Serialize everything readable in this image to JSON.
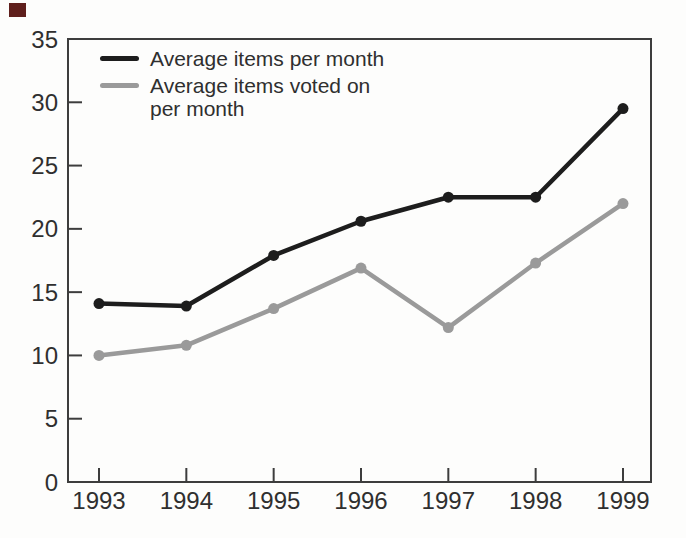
{
  "page": {
    "background": "#fdfdfc",
    "corner_marker_color": "#5f1f1c"
  },
  "chart_data": {
    "type": "line",
    "title": "",
    "xlabel": "",
    "ylabel": "",
    "categories": [
      "1993",
      "1994",
      "1995",
      "1996",
      "1997",
      "1998",
      "1999"
    ],
    "series": [
      {
        "id": "avg-items",
        "name": "Average items per month",
        "legend_lines": [
          "Average items per month"
        ],
        "color": "#1d1d1d",
        "values": [
          14.1,
          13.9,
          17.9,
          20.6,
          22.5,
          22.5,
          29.5
        ]
      },
      {
        "id": "avg-items-voted",
        "name": "Average items voted on per month",
        "legend_lines": [
          "Average items voted on",
          "per month"
        ],
        "color": "#9a9a9a",
        "values": [
          10.0,
          10.8,
          13.7,
          16.9,
          12.2,
          17.3,
          22.0
        ]
      }
    ],
    "ylim": [
      0,
      35
    ],
    "yticks": [
      0,
      5,
      10,
      15,
      20,
      25,
      30,
      35
    ],
    "grid": false,
    "legend_position": "top-left-inside",
    "axis_color": "#3d3d3d",
    "label_color": "#2f2f2f"
  }
}
